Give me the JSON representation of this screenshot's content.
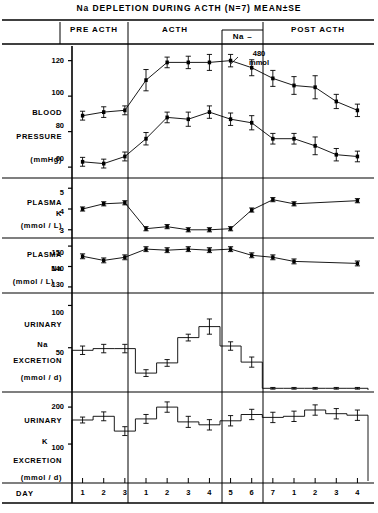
{
  "figure": {
    "title": "Na  DEPLETION   DURING   ACTH   (N=7)  MEAN±SE",
    "phase_headers": [
      {
        "label": "PRE  ACTH"
      },
      {
        "label": "ACTH"
      },
      {
        "label": "Na –"
      },
      {
        "label": "POST  ACTH"
      }
    ],
    "na_load_annotation": {
      "line1": "480",
      "line2": "mmol"
    },
    "day_axis_label": "DAY",
    "day_ticks": [
      "1",
      "2",
      "3",
      "1",
      "2",
      "3",
      "4",
      "5",
      "6",
      "7",
      "1",
      "2",
      "3",
      "4"
    ]
  },
  "chart_data": [
    {
      "type": "line",
      "title": "BLOOD PRESSURE",
      "ylabel": "BLOOD PRESSURE (mmHg)",
      "ylabel_lines": [
        "BLOOD",
        "PRESSURE",
        "(mmHg)"
      ],
      "xlabel": "DAY",
      "ylim": [
        55,
        126
      ],
      "yticks": [
        60,
        80,
        100,
        120
      ],
      "grid": false,
      "categories": [
        "1",
        "2",
        "3",
        "1",
        "2",
        "3",
        "4",
        "5",
        "6",
        "7",
        "1",
        "2",
        "3",
        "4"
      ],
      "series": [
        {
          "name": "systolic",
          "values": [
            89,
            91,
            92,
            109,
            119,
            119,
            119,
            120,
            116,
            110,
            106,
            105,
            97,
            92
          ],
          "errors": [
            2.5,
            3,
            2.5,
            6,
            3,
            3.5,
            4.5,
            3.5,
            4.5,
            4.5,
            5,
            6.5,
            4,
            3.5
          ]
        },
        {
          "name": "diastolic",
          "values": [
            63,
            62,
            66,
            76,
            88,
            87,
            91,
            87,
            85,
            76,
            76,
            72,
            67,
            66
          ],
          "errors": [
            2.5,
            2.5,
            2.5,
            3.5,
            3,
            4,
            3.5,
            3.5,
            4,
            3,
            3,
            5,
            3.5,
            3
          ]
        }
      ]
    },
    {
      "type": "line",
      "title": "PLASMA K",
      "ylabel": "PLASMA K (mmol/L)",
      "ylabel_lines": [
        "PLASMA",
        "K",
        "(mmol / L)"
      ],
      "ylim": [
        2.7,
        5.3
      ],
      "yticks": [
        3,
        4,
        5
      ],
      "grid": false,
      "categories": [
        "1",
        "2",
        "3",
        "1",
        "2",
        "3",
        "4",
        "5",
        "6",
        "7",
        "1",
        "2",
        "3",
        "4"
      ],
      "series": [
        {
          "name": "plasma K",
          "values": [
            4.0,
            4.25,
            4.3,
            3.05,
            3.15,
            3.0,
            3.0,
            3.05,
            3.95,
            4.45,
            4.25,
            4.4
          ],
          "errors": [
            0.1,
            0.1,
            0.1,
            0.1,
            0.1,
            0.1,
            0.1,
            0.1,
            0.1,
            0.1,
            0.1,
            0.1
          ],
          "x_index": [
            0,
            1,
            2,
            3,
            4,
            5,
            6,
            7,
            8,
            9,
            10,
            13
          ]
        }
      ]
    },
    {
      "type": "line",
      "title": "PLASMA Na",
      "ylabel": "PLASMA Na (mmol/L)",
      "ylabel_lines": [
        "PLASMA",
        "Na",
        "(mmol / L)"
      ],
      "ylim": [
        128,
        152
      ],
      "yticks": [
        130,
        140,
        150
      ],
      "grid": false,
      "categories": [
        "1",
        "2",
        "3",
        "1",
        "2",
        "3",
        "4",
        "5",
        "6",
        "7",
        "1",
        "2",
        "3",
        "4"
      ],
      "series": [
        {
          "name": "plasma Na",
          "values": [
            145,
            143,
            144.5,
            148.5,
            148,
            148.5,
            148,
            148.5,
            145.5,
            144.5,
            142.5,
            141.5
          ],
          "errors": [
            1.2,
            1.2,
            1.2,
            1.2,
            1.2,
            1.2,
            1.2,
            1.2,
            1.2,
            1.2,
            1.2,
            1.2
          ],
          "x_index": [
            0,
            1,
            2,
            3,
            4,
            5,
            6,
            7,
            8,
            9,
            10,
            13
          ]
        }
      ]
    },
    {
      "type": "bar",
      "title": "URINARY Na EXCRETION",
      "ylabel": "URINARY Na EXCRETION (mmol/d)",
      "ylabel_lines": [
        "URINARY",
        "Na",
        "EXCRETION",
        "(mmol / d)"
      ],
      "ylim": [
        0,
        110
      ],
      "yticks": [
        50,
        100
      ],
      "grid": false,
      "categories": [
        "1",
        "2",
        "3",
        "1",
        "2",
        "3",
        "4",
        "5",
        "6",
        "7",
        "1",
        "2",
        "3",
        "4"
      ],
      "values": [
        47,
        49,
        49,
        20,
        32,
        62,
        75,
        52,
        33,
        2,
        2,
        2,
        2,
        2
      ],
      "errors": [
        5,
        5,
        5,
        4,
        4,
        4,
        9,
        5,
        6,
        1,
        1,
        1,
        1,
        1
      ]
    },
    {
      "type": "bar",
      "title": "URINARY K EXCRETION",
      "ylabel": "URINARY K EXCRETION (mmol/d)",
      "ylabel_lines": [
        "URINARY",
        "K",
        "EXCRETION",
        "(mmol / d)"
      ],
      "ylim": [
        0,
        230
      ],
      "yticks": [
        100,
        200
      ],
      "grid": false,
      "categories": [
        "1",
        "2",
        "3",
        "1",
        "2",
        "3",
        "4",
        "5",
        "6",
        "7",
        "1",
        "2",
        "3",
        "4"
      ],
      "values": [
        165,
        175,
        135,
        168,
        200,
        160,
        152,
        163,
        180,
        172,
        175,
        192,
        182,
        178
      ],
      "errors": [
        8,
        12,
        12,
        12,
        14,
        15,
        14,
        14,
        14,
        14,
        14,
        14,
        14,
        14
      ]
    }
  ]
}
